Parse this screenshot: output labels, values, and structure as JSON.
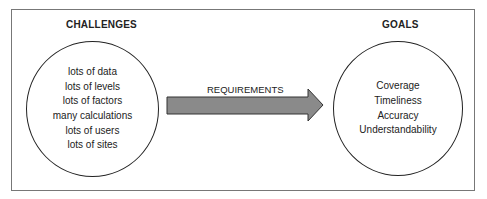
{
  "left": {
    "title": "CHALLENGES",
    "items": [
      "lots of data",
      "lots of levels",
      "lots of factors",
      "many calculations",
      "lots of users",
      "lots of sites"
    ]
  },
  "arrow": {
    "label": "REQUIREMENTS",
    "fill": "#8a8a8a"
  },
  "right": {
    "title": "GOALS",
    "items": [
      "Coverage",
      "Timeliness",
      "Accuracy",
      "Understandability"
    ]
  }
}
